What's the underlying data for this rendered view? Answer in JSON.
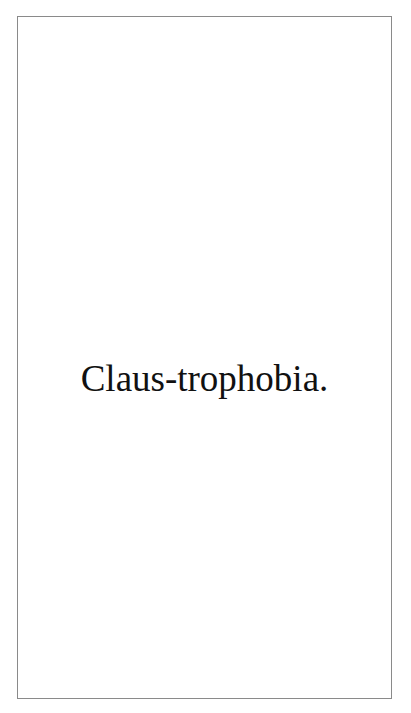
{
  "page": {
    "text": "Claus-trophobia.",
    "text_color": "#111111",
    "border_color": "#8a8a8a",
    "background": "#ffffff"
  }
}
